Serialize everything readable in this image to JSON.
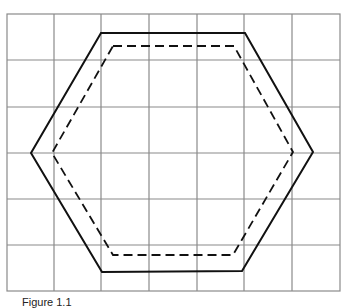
{
  "figure": {
    "caption": "Figure 1.1",
    "grid": {
      "columns": 7,
      "rows": 6,
      "line_color": "#8a8a8a"
    },
    "shapes": [
      {
        "name": "outer-hexagon",
        "style": "solid",
        "color": "#111111"
      },
      {
        "name": "inner-hexagon",
        "style": "dashed",
        "color": "#111111"
      }
    ]
  }
}
